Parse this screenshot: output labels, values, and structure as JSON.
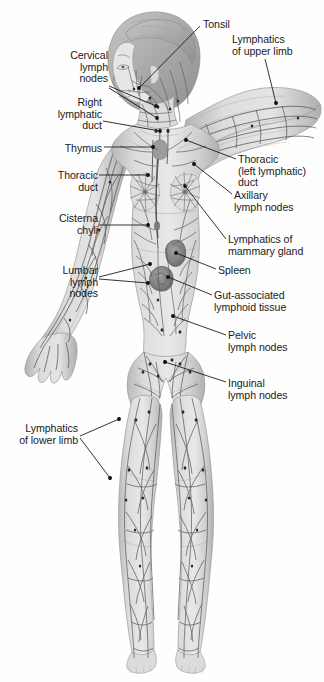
{
  "figure": {
    "background_color": "#fefefe",
    "ink_color": "#1a1a1a",
    "skin_fill": "#d7d7d7",
    "vessel_color": "#5a5a5a",
    "node_color": "#2b2b2b",
    "organ_color": "#8d8d8d"
  },
  "labels": [
    {
      "id": "tonsil",
      "text": "Tonsil",
      "align": "left",
      "x": 203,
      "y": 19,
      "anchor_x": 200,
      "anchor_y": 26,
      "leaders": [
        [
          [
            200,
            26
          ],
          [
            139,
            88
          ]
        ]
      ]
    },
    {
      "id": "lymphatics-upper-limb",
      "text": "Lymphatics\nof upper limb",
      "align": "left",
      "x": 232,
      "y": 34,
      "anchor_x": 265,
      "anchor_y": 59,
      "leaders": [
        [
          [
            265,
            59
          ],
          [
            276,
            103
          ]
        ]
      ]
    },
    {
      "id": "cervical-lymph-nodes",
      "text": "Cervical\nlymph\nnodes",
      "align": "right",
      "x": 108,
      "y": 50,
      "anchor_x": 109,
      "anchor_y": 86,
      "leaders": [
        [
          [
            109,
            86
          ],
          [
            156,
            106
          ]
        ],
        [
          [
            109,
            88
          ],
          [
            157,
            118
          ]
        ]
      ]
    },
    {
      "id": "right-lymphatic-duct",
      "text": "Right\nlymphatic\nduct",
      "align": "right",
      "x": 102,
      "y": 97,
      "anchor_x": 103,
      "anchor_y": 121,
      "leaders": [
        [
          [
            103,
            121
          ],
          [
            160,
            131
          ]
        ]
      ]
    },
    {
      "id": "thymus",
      "text": "Thymus",
      "align": "right",
      "x": 102,
      "y": 143,
      "anchor_x": 104,
      "anchor_y": 147,
      "leaders": [
        [
          [
            104,
            147
          ],
          [
            153,
            147
          ]
        ]
      ]
    },
    {
      "id": "thoracic-left-lymphatic-duct",
      "text": "Thoracic\n(left lymphatic)\nduct",
      "align": "left",
      "x": 238,
      "y": 154,
      "anchor_x": 236,
      "anchor_y": 159,
      "leaders": [
        [
          [
            236,
            159
          ],
          [
            186,
            140
          ]
        ]
      ]
    },
    {
      "id": "thoracic-duct",
      "text": "Thoracic\nduct",
      "align": "right",
      "x": 98,
      "y": 170,
      "anchor_x": 99,
      "anchor_y": 175,
      "leaders": [
        [
          [
            99,
            175
          ],
          [
            148,
            175
          ]
        ]
      ]
    },
    {
      "id": "axillary-lymph-nodes",
      "text": "Axillary\nlymph nodes",
      "align": "left",
      "x": 234,
      "y": 190,
      "anchor_x": 232,
      "anchor_y": 194,
      "leaders": [
        [
          [
            232,
            194
          ],
          [
            194,
            164
          ]
        ]
      ]
    },
    {
      "id": "cisterna-chyli",
      "text": "Cisterna\nchyli",
      "align": "right",
      "x": 98,
      "y": 213,
      "anchor_x": 99,
      "anchor_y": 225,
      "leaders": [
        [
          [
            99,
            225
          ],
          [
            148,
            225
          ]
        ]
      ]
    },
    {
      "id": "lymphatics-mammary-gland",
      "text": "Lymphatics of\nmammary gland",
      "align": "left",
      "x": 228,
      "y": 234,
      "anchor_x": 226,
      "anchor_y": 239,
      "leaders": [
        [
          [
            226,
            239
          ],
          [
            185,
            186
          ]
        ]
      ]
    },
    {
      "id": "lumbar-lymph-nodes",
      "text": "Lumbar\nlymph\nnodes",
      "align": "right",
      "x": 98,
      "y": 265,
      "anchor_x": 99,
      "anchor_y": 277,
      "leaders": [
        [
          [
            99,
            277
          ],
          [
            150,
            264
          ]
        ],
        [
          [
            99,
            279
          ],
          [
            148,
            283
          ]
        ]
      ]
    },
    {
      "id": "spleen",
      "text": "Spleen",
      "align": "left",
      "x": 218,
      "y": 265,
      "anchor_x": 216,
      "anchor_y": 269,
      "leaders": [
        [
          [
            216,
            269
          ],
          [
            176,
            253
          ]
        ]
      ]
    },
    {
      "id": "gut-associated-lymphoid-tissue",
      "text": "Gut-associated\nlymphoid tissue",
      "align": "left",
      "x": 214,
      "y": 290,
      "anchor_x": 212,
      "anchor_y": 295,
      "leaders": [
        [
          [
            212,
            295
          ],
          [
            168,
            277
          ]
        ]
      ]
    },
    {
      "id": "pelvic-lymph-nodes",
      "text": "Pelvic\nlymph nodes",
      "align": "left",
      "x": 228,
      "y": 330,
      "anchor_x": 226,
      "anchor_y": 335,
      "leaders": [
        [
          [
            226,
            335
          ],
          [
            173,
            316
          ]
        ]
      ]
    },
    {
      "id": "inguinal-lymph-nodes",
      "text": "Inguinal\nlymph nodes",
      "align": "left",
      "x": 228,
      "y": 378,
      "anchor_x": 226,
      "anchor_y": 382,
      "leaders": [
        [
          [
            226,
            382
          ],
          [
            165,
            362
          ]
        ]
      ]
    },
    {
      "id": "lymphatics-lower-limb",
      "text": "Lymphatics\nof lower limb",
      "align": "right",
      "x": 78,
      "y": 423,
      "anchor_x": 80,
      "anchor_y": 436,
      "leaders": [
        [
          [
            80,
            436
          ],
          [
            119,
            419
          ]
        ],
        [
          [
            80,
            438
          ],
          [
            110,
            478
          ]
        ]
      ]
    }
  ],
  "lymph_node_points": [
    [
      139,
      88
    ],
    [
      156,
      106
    ],
    [
      157,
      118
    ],
    [
      160,
      131
    ],
    [
      153,
      147
    ],
    [
      186,
      140
    ],
    [
      148,
      175
    ],
    [
      194,
      164
    ],
    [
      148,
      225
    ],
    [
      185,
      186
    ],
    [
      150,
      264
    ],
    [
      148,
      283
    ],
    [
      176,
      253
    ],
    [
      168,
      277
    ],
    [
      173,
      316
    ],
    [
      165,
      362
    ],
    [
      119,
      419
    ],
    [
      110,
      478
    ]
  ],
  "organs": [
    {
      "name": "spleen",
      "cx": 176,
      "cy": 253
    },
    {
      "name": "gut-associated-lymphoid-tissue",
      "cx": 165,
      "cy": 278
    }
  ]
}
